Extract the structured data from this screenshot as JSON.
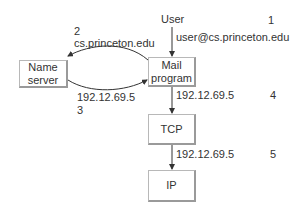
{
  "diagram": {
    "nodes": {
      "user": {
        "label": "User"
      },
      "name_server": {
        "line1": "Name",
        "line2": "server"
      },
      "mail_program": {
        "line1": "Mail",
        "line2": "program"
      },
      "tcp": {
        "label": "TCP"
      },
      "ip": {
        "label": "IP"
      }
    },
    "edges": [
      {
        "from": "user",
        "to": "mail_program",
        "step": "1",
        "label": "user@cs.princeton.edu"
      },
      {
        "from": "mail_program",
        "to": "name_server",
        "step": "2",
        "label": "cs.princeton.edu"
      },
      {
        "from": "name_server",
        "to": "mail_program",
        "step": "3",
        "label": "192.12.69.5"
      },
      {
        "from": "mail_program",
        "to": "tcp",
        "step": "4",
        "label": "192.12.69.5"
      },
      {
        "from": "tcp",
        "to": "ip",
        "step": "5",
        "label": "192.12.69.5"
      }
    ],
    "colors": {
      "line": "#333333",
      "box_border": "#b8b8b8",
      "text": "#333333"
    }
  }
}
